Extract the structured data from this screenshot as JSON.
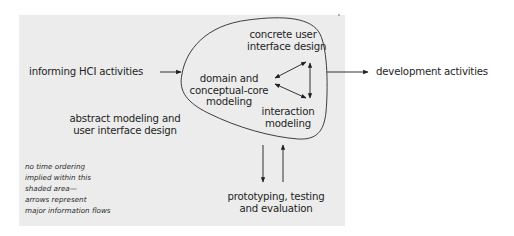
{
  "diagram": {
    "title": "",
    "colors": {
      "shade": "#ececec",
      "ink": "#1e1e1e",
      "background": "#ffffff"
    },
    "shaded_area": {
      "label_lines": [
        "abstract modeling and",
        "user interface design"
      ]
    },
    "nodes": {
      "informing": {
        "label": "informing HCI activities"
      },
      "development": {
        "label": "development activities"
      },
      "concrete": {
        "label_lines": [
          "concrete user",
          "interface design"
        ]
      },
      "domain": {
        "label_lines": [
          "domain and",
          "conceptual-core",
          "modeling"
        ]
      },
      "interaction": {
        "label_lines": [
          "interaction",
          "modeling"
        ]
      },
      "prototyping": {
        "label_lines": [
          "prototyping, testing",
          "and evaluation"
        ]
      }
    },
    "note": {
      "lines": [
        "no time ordering",
        "implied within this",
        "shaded area—",
        "arrows represent",
        "major information flows"
      ]
    },
    "edges": [
      {
        "from": "informing HCI activities",
        "to": "core blob",
        "type": "arrow"
      },
      {
        "from": "core blob",
        "to": "development activities",
        "type": "arrow"
      },
      {
        "from": "domain and conceptual-core modeling",
        "to": "concrete user interface design",
        "type": "bidirectional"
      },
      {
        "from": "domain and conceptual-core modeling",
        "to": "interaction modeling",
        "type": "bidirectional"
      },
      {
        "from": "concrete user interface design",
        "to": "interaction modeling",
        "type": "bidirectional"
      },
      {
        "from": "core blob",
        "to": "prototyping, testing and evaluation",
        "type": "arrow"
      },
      {
        "from": "prototyping, testing and evaluation",
        "to": "core blob",
        "type": "arrow"
      }
    ]
  }
}
